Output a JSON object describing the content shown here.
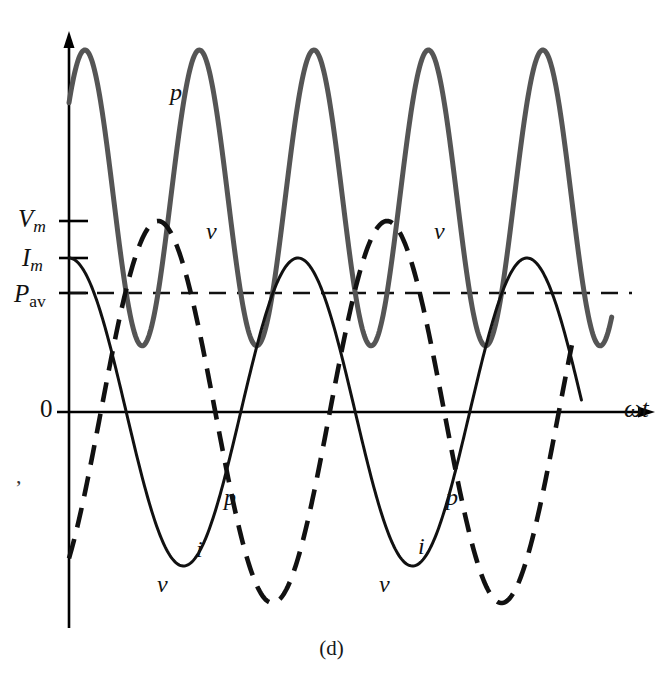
{
  "caption": "(d)",
  "axis": {
    "x_label": "ωt",
    "y_ticks": [
      {
        "id": "vm",
        "base": "V",
        "sub": "m",
        "value_px_y": 221
      },
      {
        "id": "im",
        "base": "I",
        "sub": "m",
        "value_px_y": 258
      },
      {
        "id": "pav",
        "base": "P",
        "sub": "av",
        "value_px_y": 293
      }
    ],
    "origin_label": "0"
  },
  "curve_labels": {
    "p": "p",
    "v": "v",
    "i": "i"
  },
  "stray_mark": ",",
  "chart_data": {
    "type": "line",
    "title": "",
    "subtitle": "",
    "xlabel": "ωt",
    "ylabel": "",
    "grid": false,
    "legend_position": "inline-annotations",
    "x": [
      0,
      0.25,
      0.5,
      0.75,
      1,
      1.25,
      1.5,
      1.75,
      2,
      2.25,
      2.5
    ],
    "x_unit": "periods of v",
    "axis_ranges": {
      "xlim": [
        0,
        2.45
      ],
      "ylim": [
        -1.1,
        1.0
      ]
    },
    "reference_lines": [
      {
        "name": "P_av",
        "label": "P",
        "sublabel": "av",
        "value": 0.305,
        "style": "dashed",
        "color": "#111111"
      }
    ],
    "tick_values": {
      "V_m": 0.78,
      "I_m": 0.6,
      "P_av": 0.305
    },
    "series": [
      {
        "name": "v",
        "label": "v",
        "style": "dashed",
        "color": "#111111",
        "width_px": 4.5,
        "form": "sinusoid",
        "amplitude": 0.78,
        "phase_deg": -50,
        "period_px": 229,
        "description": "voltage sinusoid, dashed, peak V_m"
      },
      {
        "name": "i",
        "label": "i",
        "style": "solid",
        "color": "#111111",
        "width_px": 3.0,
        "form": "sinusoid",
        "amplitude": 0.6,
        "phase_deg": 0,
        "period_px": 229,
        "description": "current sinusoid, solid thin, peak I_m, leads v by about 50 degrees"
      },
      {
        "name": "p",
        "label": "p",
        "style": "solid",
        "color": "#555555",
        "width_px": 5.0,
        "form": "product v*i",
        "amplitude": 1.0,
        "period_px": 114.5,
        "offset": 0.305,
        "description": "instantaneous power p = v*i, double frequency, oscillates about P_av"
      }
    ],
    "annotations": [
      {
        "text": "p",
        "x_px": 176,
        "y_px": 92
      },
      {
        "text": "v",
        "x_px": 213,
        "y_px": 231
      },
      {
        "text": "v",
        "x_px": 441,
        "y_px": 231
      },
      {
        "text": "p",
        "x_px": 231,
        "y_px": 497
      },
      {
        "text": "i",
        "x_px": 201,
        "y_px": 549
      },
      {
        "text": "v",
        "x_px": 163,
        "y_px": 584
      },
      {
        "text": "p",
        "x_px": 453,
        "y_px": 497
      },
      {
        "text": "i",
        "x_px": 423,
        "y_px": 546
      },
      {
        "text": "v",
        "x_px": 385,
        "y_px": 584
      }
    ],
    "colors": {
      "v": "#111111",
      "i": "#111111",
      "p": "#555555",
      "axis": "#000000",
      "background": "#ffffff"
    }
  }
}
